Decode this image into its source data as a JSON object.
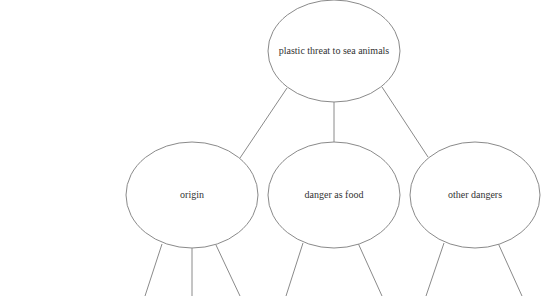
{
  "diagram": {
    "type": "tree",
    "colors": {
      "stroke": "#8a8a8a",
      "text": "#333333",
      "background": "#ffffff"
    },
    "root": {
      "label": "plastic threat to sea animals"
    },
    "children": [
      {
        "label": "origin"
      },
      {
        "label": "danger as food"
      },
      {
        "label": "other dangers"
      }
    ]
  }
}
